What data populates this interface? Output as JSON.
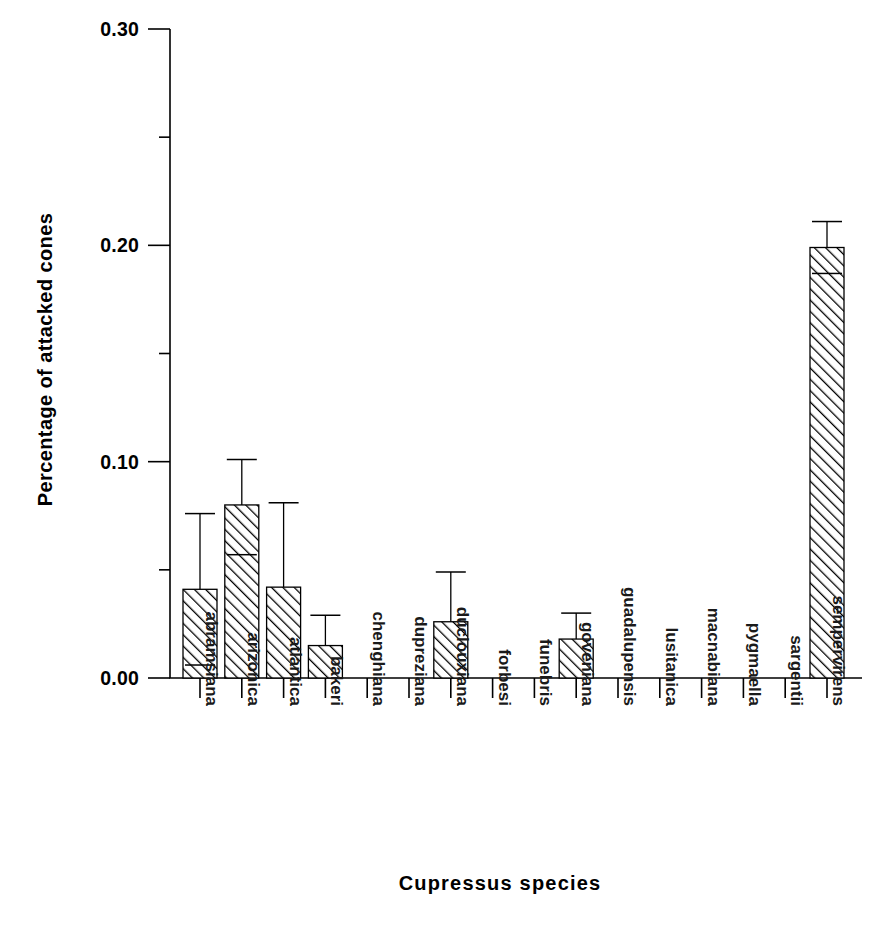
{
  "chart_data": {
    "type": "bar",
    "title": "",
    "xlabel": "Cupressus species",
    "ylabel": "Percentage of attacked cones",
    "ylim": [
      0.0,
      0.3
    ],
    "grid": false,
    "legend": null,
    "ytick_labels": [
      "0.00",
      "0.10",
      "0.20",
      "0.30"
    ],
    "ytick_values": [
      0.0,
      0.1,
      0.2,
      0.3
    ],
    "yminor_values": [
      0.05,
      0.15,
      0.25
    ],
    "categories": [
      "abramsiana",
      "arizonica",
      "atlantica",
      "bakeri",
      "chenghiana",
      "dupreziana",
      "duclouxiana",
      "forbesi",
      "funebris",
      "goveniana",
      "guadalupensis",
      "lusitanica",
      "macnabiana",
      "pygmaella",
      "sargentii",
      "sempervirens"
    ],
    "values": [
      0.041,
      0.08,
      0.042,
      0.015,
      0.0,
      0.0,
      0.026,
      0.0,
      0.0,
      0.018,
      0.0,
      0.0,
      0.0,
      0.0,
      0.0,
      0.199
    ],
    "err_upper": [
      0.076,
      0.101,
      0.081,
      0.029,
      null,
      null,
      0.049,
      null,
      null,
      0.03,
      null,
      null,
      null,
      null,
      null,
      0.211
    ],
    "err_lower": [
      0.006,
      0.057,
      null,
      null,
      null,
      null,
      null,
      null,
      null,
      null,
      null,
      null,
      null,
      null,
      null,
      0.187
    ],
    "bar_style": {
      "fill": "diagonal-hatch",
      "hatch_color": "#000000",
      "edge_color": "#000000",
      "face_color": "#ffffff"
    }
  }
}
